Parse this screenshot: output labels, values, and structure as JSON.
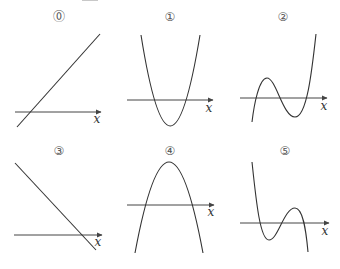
{
  "figure": {
    "panels": [
      {
        "id": "0",
        "label": "⓪",
        "kind": "line-increasing",
        "axis_label": "x"
      },
      {
        "id": "1",
        "label": "①",
        "kind": "parabola-upward",
        "axis_label": "x"
      },
      {
        "id": "2",
        "label": "②",
        "kind": "cubic-positive-leading",
        "axis_label": "x"
      },
      {
        "id": "3",
        "label": "③",
        "kind": "line-decreasing",
        "axis_label": "x"
      },
      {
        "id": "4",
        "label": "④",
        "kind": "parabola-downward",
        "axis_label": "x"
      },
      {
        "id": "5",
        "label": "⑤",
        "kind": "cubic-negative-leading",
        "axis_label": "x"
      }
    ],
    "colors": {
      "curve": "#333333",
      "axis": "#444444",
      "label": "#555555"
    }
  }
}
